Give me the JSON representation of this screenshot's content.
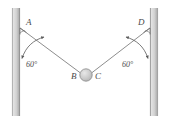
{
  "figure": {
    "type": "physics-free-body-diagram",
    "background_color": "#ffffff",
    "walls": {
      "color_light": "#d8d8d8",
      "color_dark": "#9a9a9a",
      "left": {
        "x": 12,
        "y": 8,
        "width": 8,
        "height": 108
      },
      "right": {
        "x": 150,
        "y": 8,
        "width": 8,
        "height": 108
      }
    },
    "cords": {
      "color": "#6e6e6e",
      "left": {
        "x1": 23,
        "y1": 28,
        "x2": 80,
        "y2": 73
      },
      "right": {
        "x1": 149,
        "y1": 28,
        "x2": 92,
        "y2": 73
      }
    },
    "ball": {
      "cx": 86,
      "cy": 75,
      "r": 6,
      "fill": "#cfcfcf",
      "stroke": "#8a8a8a"
    },
    "labels": {
      "point_a": "A",
      "point_b": "B",
      "point_c": "C",
      "point_d": "D",
      "angle_left": "60°",
      "angle_right": "60°"
    },
    "label_positions": {
      "point_a": {
        "x": 26,
        "y": 24
      },
      "point_d": {
        "x": 139,
        "y": 24
      },
      "point_b": {
        "x": 73,
        "y": 80
      },
      "point_c": {
        "x": 96,
        "y": 80
      },
      "angle_left": {
        "x": 27,
        "y": 65
      },
      "angle_right": {
        "x": 123,
        "y": 65
      }
    }
  }
}
